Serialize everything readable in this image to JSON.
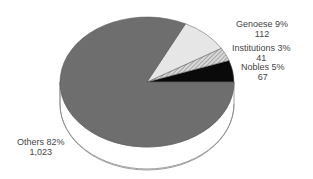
{
  "chart_data": {
    "type": "pie",
    "title": "",
    "categories": [
      "Others",
      "Genoese",
      "Institutions",
      "Nobles"
    ],
    "values": [
      1023,
      112,
      41,
      67
    ],
    "percentages": [
      82,
      9,
      3,
      5
    ],
    "colors": [
      "#6e6e6e",
      "#e6e6e6",
      "#b0b0b0",
      "#0a0a0a"
    ],
    "labels": [
      {
        "name": "Others",
        "pct": "Others 82%",
        "count": "1,023"
      },
      {
        "name": "Genoese",
        "pct": "Genoese 9%",
        "count": "112"
      },
      {
        "name": "Institutions",
        "pct": "Institutions 3%",
        "count": "41"
      },
      {
        "name": "Nobles",
        "pct": "Nobles 5%",
        "count": "67"
      }
    ],
    "legend": "none",
    "style": "3d-tilted"
  }
}
